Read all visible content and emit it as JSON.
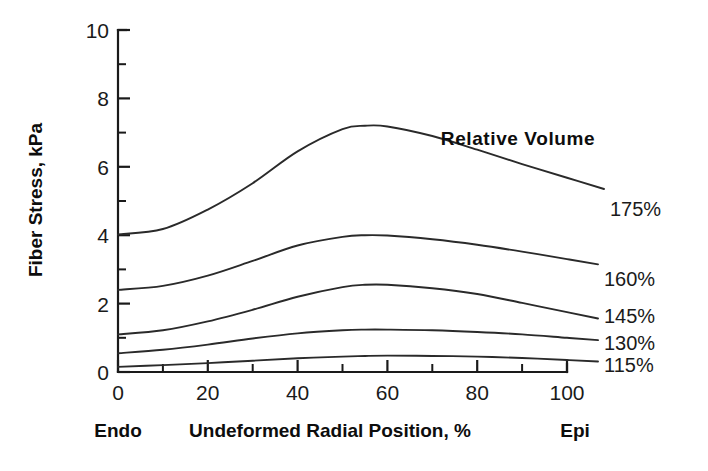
{
  "chart_data": {
    "type": "line",
    "title": "",
    "xlabel": "Undeformed Radial Position, %",
    "ylabel": "Fiber Stress, kPa",
    "xlim": [
      0,
      100
    ],
    "ylim": [
      0,
      10
    ],
    "grid": false,
    "legend_position": "right-inline",
    "legend_title": "Relative Volume",
    "x_ticks": [
      0,
      20,
      40,
      60,
      80,
      100
    ],
    "x_tick_labels": [
      "0",
      "20",
      "40",
      "60",
      "80",
      "100"
    ],
    "x_minor_ticks": [
      10,
      30,
      50,
      70,
      90
    ],
    "y_ticks": [
      0,
      2,
      4,
      6,
      8,
      10
    ],
    "y_tick_labels": [
      "0",
      "2",
      "4",
      "6",
      "8",
      "10"
    ],
    "y_minor_ticks": [
      1,
      3,
      5,
      7,
      9
    ],
    "x_axis_start_annotation": "Endo",
    "x_axis_end_annotation": "Epi",
    "x": [
      0,
      10,
      20,
      30,
      40,
      50,
      55,
      60,
      70,
      80,
      90,
      100
    ],
    "series": [
      {
        "name": "175%",
        "label": "175%",
        "values": [
          4.02,
          4.18,
          4.75,
          5.52,
          6.45,
          7.1,
          7.2,
          7.18,
          6.9,
          6.5,
          6.08,
          5.68
        ]
      },
      {
        "name": "160%",
        "label": "160%",
        "values": [
          2.4,
          2.52,
          2.82,
          3.25,
          3.7,
          3.95,
          4.0,
          3.99,
          3.88,
          3.72,
          3.52,
          3.3
        ]
      },
      {
        "name": "145%",
        "label": "145%",
        "values": [
          1.1,
          1.22,
          1.48,
          1.82,
          2.2,
          2.48,
          2.55,
          2.55,
          2.45,
          2.28,
          2.02,
          1.75
        ]
      },
      {
        "name": "130%",
        "label": "130%",
        "values": [
          0.55,
          0.65,
          0.8,
          0.98,
          1.13,
          1.22,
          1.24,
          1.24,
          1.22,
          1.17,
          1.1,
          1.0
        ]
      },
      {
        "name": "115%",
        "label": "115%",
        "values": [
          0.15,
          0.2,
          0.26,
          0.33,
          0.4,
          0.45,
          0.47,
          0.48,
          0.47,
          0.45,
          0.41,
          0.35
        ]
      }
    ]
  },
  "labels": {
    "y_axis_title": "Fiber Stress, kPa",
    "x_axis_title": "Undeformed Radial Position, %",
    "legend_title": "Relative Volume",
    "endo": "Endo",
    "epi": "Epi",
    "ytick_0": "0",
    "ytick_2": "2",
    "ytick_4": "4",
    "ytick_6": "6",
    "ytick_8": "8",
    "ytick_10": "10",
    "xtick_0": "0",
    "xtick_20": "20",
    "xtick_40": "40",
    "xtick_60": "60",
    "xtick_80": "80",
    "xtick_100": "100",
    "series_175": "175%",
    "series_160": "160%",
    "series_145": "145%",
    "series_130": "130%",
    "series_115": "115%"
  },
  "colors": {
    "background": "#ffffff",
    "axis": "#1a1a1a",
    "curve": "#2a2a2a",
    "text": "#0d0d0d"
  }
}
